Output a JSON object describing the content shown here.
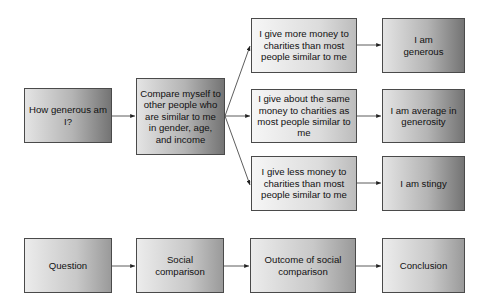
{
  "diagram": {
    "example_row": {
      "question": "How generous am I?",
      "comparison": "Compare myself to other people who are similar to me in gender, age, and income",
      "outcomes": [
        "I give more money to charities than most people similar to me",
        "I give about the same money to charities as most people similar to me",
        "I give less money to charities than most people similar to me"
      ],
      "conclusions": [
        "I am generous",
        "I am average in generosity",
        "I am stingy"
      ]
    },
    "legend_row": {
      "stages": [
        "Question",
        "Social comparison",
        "Outcome of social comparison",
        "Conclusion"
      ]
    },
    "colors": {
      "border": "#4a4a4a",
      "arrow": "#222222",
      "gradient_light": "#e4e4e4",
      "gradient_dark": "#747474"
    }
  }
}
